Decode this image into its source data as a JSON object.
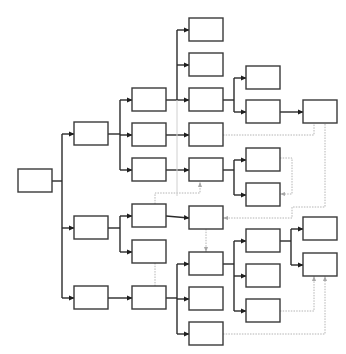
{
  "diagram": {
    "type": "tree-flowchart",
    "width": 346,
    "height": 354,
    "colors": {
      "background": "#ffffff",
      "node_border": "#3a3a3a",
      "edge": "#2a2a2a",
      "dotted_edge": "#b4b4b4"
    },
    "node_size": {
      "w": 34,
      "h": 23
    },
    "nodes": [
      {
        "id": "root",
        "x": 18,
        "y": 169,
        "label": ""
      },
      {
        "id": "L1a",
        "x": 74,
        "y": 122,
        "label": ""
      },
      {
        "id": "L1b",
        "x": 74,
        "y": 216,
        "label": ""
      },
      {
        "id": "L1c",
        "x": 74,
        "y": 286,
        "label": ""
      },
      {
        "id": "L2a",
        "x": 132,
        "y": 88,
        "label": ""
      },
      {
        "id": "L2b",
        "x": 132,
        "y": 123,
        "label": ""
      },
      {
        "id": "L2c",
        "x": 132,
        "y": 158,
        "label": ""
      },
      {
        "id": "L2d",
        "x": 132,
        "y": 204,
        "label": ""
      },
      {
        "id": "L2e",
        "x": 132,
        "y": 240,
        "label": ""
      },
      {
        "id": "L2f",
        "x": 132,
        "y": 286,
        "label": ""
      },
      {
        "id": "L3a",
        "x": 189,
        "y": 18,
        "label": ""
      },
      {
        "id": "L3b",
        "x": 189,
        "y": 53,
        "label": ""
      },
      {
        "id": "L3c",
        "x": 189,
        "y": 88,
        "label": ""
      },
      {
        "id": "L3d",
        "x": 189,
        "y": 123,
        "label": ""
      },
      {
        "id": "L3e",
        "x": 189,
        "y": 158,
        "label": ""
      },
      {
        "id": "L3f",
        "x": 189,
        "y": 206,
        "label": ""
      },
      {
        "id": "L3g",
        "x": 189,
        "y": 252,
        "label": ""
      },
      {
        "id": "L3h",
        "x": 189,
        "y": 287,
        "label": ""
      },
      {
        "id": "L3i",
        "x": 189,
        "y": 322,
        "label": ""
      },
      {
        "id": "L4a",
        "x": 246,
        "y": 66,
        "label": ""
      },
      {
        "id": "L4b",
        "x": 246,
        "y": 100,
        "label": ""
      },
      {
        "id": "L4c",
        "x": 246,
        "y": 148,
        "label": ""
      },
      {
        "id": "L4d",
        "x": 246,
        "y": 183,
        "label": ""
      },
      {
        "id": "L4e",
        "x": 246,
        "y": 229,
        "label": ""
      },
      {
        "id": "L4f",
        "x": 246,
        "y": 264,
        "label": ""
      },
      {
        "id": "L4g",
        "x": 246,
        "y": 299,
        "label": ""
      },
      {
        "id": "L5a",
        "x": 303,
        "y": 100,
        "label": ""
      },
      {
        "id": "L5b",
        "x": 303,
        "y": 217,
        "label": ""
      },
      {
        "id": "L5c",
        "x": 303,
        "y": 253,
        "label": ""
      }
    ],
    "edges": [
      {
        "style": "solid",
        "points": [
          [
            52,
            181
          ],
          [
            62,
            181
          ]
        ]
      },
      {
        "style": "solid",
        "points": [
          [
            62,
            134
          ],
          [
            62,
            298
          ]
        ]
      },
      {
        "style": "solid",
        "arrow": true,
        "points": [
          [
            62,
            134
          ],
          [
            74,
            134
          ]
        ]
      },
      {
        "style": "solid",
        "arrow": true,
        "points": [
          [
            62,
            228
          ],
          [
            74,
            228
          ]
        ]
      },
      {
        "style": "solid",
        "arrow": true,
        "points": [
          [
            62,
            298
          ],
          [
            74,
            298
          ]
        ]
      },
      {
        "style": "solid",
        "points": [
          [
            108,
            134
          ],
          [
            120,
            134
          ]
        ]
      },
      {
        "style": "solid",
        "points": [
          [
            120,
            100
          ],
          [
            120,
            170
          ]
        ]
      },
      {
        "style": "solid",
        "arrow": true,
        "points": [
          [
            120,
            100
          ],
          [
            132,
            100
          ]
        ]
      },
      {
        "style": "solid",
        "arrow": true,
        "points": [
          [
            120,
            135
          ],
          [
            132,
            135
          ]
        ]
      },
      {
        "style": "solid",
        "arrow": true,
        "points": [
          [
            120,
            170
          ],
          [
            132,
            170
          ]
        ]
      },
      {
        "style": "solid",
        "points": [
          [
            108,
            228
          ],
          [
            120,
            228
          ]
        ]
      },
      {
        "style": "solid",
        "points": [
          [
            120,
            216
          ],
          [
            120,
            252
          ]
        ]
      },
      {
        "style": "solid",
        "arrow": true,
        "points": [
          [
            120,
            216
          ],
          [
            132,
            216
          ]
        ]
      },
      {
        "style": "solid",
        "arrow": true,
        "points": [
          [
            120,
            252
          ],
          [
            132,
            252
          ]
        ]
      },
      {
        "style": "solid",
        "arrow": true,
        "points": [
          [
            108,
            298
          ],
          [
            132,
            298
          ]
        ]
      },
      {
        "style": "solid",
        "points": [
          [
            166,
            100
          ],
          [
            177,
            100
          ]
        ]
      },
      {
        "style": "solid",
        "points": [
          [
            177,
            30
          ],
          [
            177,
            100
          ]
        ]
      },
      {
        "style": "solid",
        "arrow": true,
        "points": [
          [
            177,
            30
          ],
          [
            189,
            30
          ]
        ]
      },
      {
        "style": "solid",
        "arrow": true,
        "points": [
          [
            177,
            65
          ],
          [
            189,
            65
          ]
        ]
      },
      {
        "style": "solid",
        "arrow": true,
        "points": [
          [
            177,
            100
          ],
          [
            189,
            100
          ]
        ]
      },
      {
        "style": "solid",
        "arrow": true,
        "points": [
          [
            166,
            135
          ],
          [
            189,
            135
          ]
        ]
      },
      {
        "style": "solid",
        "arrow": true,
        "points": [
          [
            166,
            170
          ],
          [
            189,
            170
          ]
        ]
      },
      {
        "style": "solid",
        "arrow": true,
        "points": [
          [
            166,
            216
          ],
          [
            189,
            218
          ]
        ]
      },
      {
        "style": "solid",
        "points": [
          [
            166,
            298
          ],
          [
            177,
            298
          ]
        ]
      },
      {
        "style": "solid",
        "points": [
          [
            177,
            264
          ],
          [
            177,
            334
          ]
        ]
      },
      {
        "style": "solid",
        "arrow": true,
        "points": [
          [
            177,
            264
          ],
          [
            189,
            264
          ]
        ]
      },
      {
        "style": "solid",
        "arrow": true,
        "points": [
          [
            177,
            299
          ],
          [
            189,
            299
          ]
        ]
      },
      {
        "style": "solid",
        "arrow": true,
        "points": [
          [
            177,
            334
          ],
          [
            189,
            334
          ]
        ]
      },
      {
        "style": "solid",
        "points": [
          [
            223,
            100
          ],
          [
            234,
            100
          ]
        ]
      },
      {
        "style": "solid",
        "points": [
          [
            234,
            78
          ],
          [
            234,
            112
          ]
        ]
      },
      {
        "style": "solid",
        "arrow": true,
        "points": [
          [
            234,
            78
          ],
          [
            246,
            78
          ]
        ]
      },
      {
        "style": "solid",
        "arrow": true,
        "points": [
          [
            234,
            112
          ],
          [
            246,
            112
          ]
        ]
      },
      {
        "style": "solid",
        "arrow": true,
        "points": [
          [
            280,
            112
          ],
          [
            303,
            112
          ]
        ]
      },
      {
        "style": "solid",
        "points": [
          [
            223,
            170
          ],
          [
            234,
            170
          ]
        ]
      },
      {
        "style": "solid",
        "points": [
          [
            234,
            160
          ],
          [
            234,
            195
          ]
        ]
      },
      {
        "style": "solid",
        "arrow": true,
        "points": [
          [
            234,
            160
          ],
          [
            246,
            160
          ]
        ]
      },
      {
        "style": "solid",
        "arrow": true,
        "points": [
          [
            234,
            195
          ],
          [
            246,
            195
          ]
        ]
      },
      {
        "style": "solid",
        "points": [
          [
            223,
            264
          ],
          [
            234,
            264
          ]
        ]
      },
      {
        "style": "solid",
        "points": [
          [
            234,
            241
          ],
          [
            234,
            311
          ]
        ]
      },
      {
        "style": "solid",
        "arrow": true,
        "points": [
          [
            234,
            241
          ],
          [
            246,
            241
          ]
        ]
      },
      {
        "style": "solid",
        "arrow": true,
        "points": [
          [
            234,
            276
          ],
          [
            246,
            276
          ]
        ]
      },
      {
        "style": "solid",
        "arrow": true,
        "points": [
          [
            234,
            311
          ],
          [
            246,
            311
          ]
        ]
      },
      {
        "style": "solid",
        "points": [
          [
            280,
            241
          ],
          [
            291,
            241
          ]
        ]
      },
      {
        "style": "solid",
        "points": [
          [
            291,
            229
          ],
          [
            291,
            265
          ]
        ]
      },
      {
        "style": "solid",
        "arrow": true,
        "points": [
          [
            291,
            229
          ],
          [
            303,
            229
          ]
        ]
      },
      {
        "style": "solid",
        "arrow": true,
        "points": [
          [
            291,
            265
          ],
          [
            303,
            265
          ]
        ]
      },
      {
        "style": "dotted",
        "points": [
          [
            223,
            135
          ],
          [
            314,
            135
          ],
          [
            314,
            124
          ]
        ]
      },
      {
        "style": "dotted",
        "arrow": true,
        "points": [
          [
            325,
            124
          ],
          [
            325,
            207
          ],
          [
            292,
            207
          ],
          [
            292,
            218
          ],
          [
            223,
            218
          ]
        ]
      },
      {
        "style": "dotted",
        "arrow": true,
        "points": [
          [
            280,
            158
          ],
          [
            292,
            158
          ],
          [
            292,
            194
          ],
          [
            280,
            194
          ]
        ]
      },
      {
        "style": "dotted",
        "arrow": true,
        "points": [
          [
            155,
            204
          ],
          [
            155,
            193
          ],
          [
            200,
            193
          ],
          [
            200,
            182
          ]
        ]
      },
      {
        "style": "dotted",
        "arrow": true,
        "points": [
          [
            206,
            229
          ],
          [
            206,
            252
          ]
        ]
      },
      {
        "style": "dotted",
        "points": [
          [
            155,
            263
          ],
          [
            155,
            286
          ]
        ]
      },
      {
        "style": "dotted",
        "arrow": true,
        "points": [
          [
            280,
            311
          ],
          [
            314,
            311
          ],
          [
            314,
            276
          ]
        ]
      },
      {
        "style": "dotted",
        "arrow": true,
        "points": [
          [
            223,
            334
          ],
          [
            325,
            334
          ],
          [
            325,
            276
          ]
        ]
      },
      {
        "style": "faint",
        "points": [
          [
            177,
            100
          ],
          [
            177,
            196
          ]
        ]
      }
    ]
  }
}
